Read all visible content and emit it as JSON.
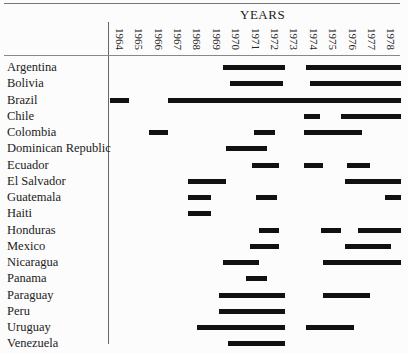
{
  "chart_data": {
    "type": "gantt",
    "title": "YEARS",
    "xlabel": "YEARS",
    "ylabel": "",
    "x_ticks": [
      "1964",
      "1965",
      "1966",
      "1967",
      "1968",
      "1969",
      "1970",
      "1971",
      "1972",
      "1973",
      "1974",
      "1975",
      "1976",
      "1977",
      "1978"
    ],
    "x_range": [
      1964,
      1979
    ],
    "grid": false,
    "legend": null,
    "rows": [
      {
        "label": "Argentina",
        "bars": [
          [
            1969.8,
            1973.0
          ],
          [
            1974.1,
            1979.0
          ]
        ]
      },
      {
        "label": "Bolivia",
        "bars": [
          [
            1970.2,
            1972.9
          ],
          [
            1974.3,
            1979.0
          ]
        ]
      },
      {
        "label": "Brazil",
        "bars": [
          [
            1964.0,
            1965.0
          ],
          [
            1967.0,
            1979.0
          ]
        ]
      },
      {
        "label": "Chile",
        "bars": [
          [
            1974.0,
            1974.8
          ],
          [
            1975.9,
            1979.0
          ]
        ]
      },
      {
        "label": "Colombia",
        "bars": [
          [
            1966.0,
            1967.0
          ],
          [
            1971.4,
            1972.5
          ],
          [
            1974.0,
            1977.0
          ]
        ]
      },
      {
        "label": "Dominican Republic",
        "bars": [
          [
            1970.0,
            1972.1
          ]
        ]
      },
      {
        "label": "Ecuador",
        "bars": [
          [
            1971.3,
            1972.7
          ],
          [
            1974.0,
            1975.0
          ],
          [
            1976.2,
            1977.4
          ]
        ]
      },
      {
        "label": "El Salvador",
        "bars": [
          [
            1968.0,
            1970.0
          ],
          [
            1976.1,
            1979.0
          ]
        ]
      },
      {
        "label": "Guatemala",
        "bars": [
          [
            1968.0,
            1969.2
          ],
          [
            1971.5,
            1972.6
          ],
          [
            1978.2,
            1979.0
          ]
        ]
      },
      {
        "label": "Haiti",
        "bars": [
          [
            1968.0,
            1969.2
          ]
        ]
      },
      {
        "label": "Honduras",
        "bars": [
          [
            1971.7,
            1972.7
          ],
          [
            1974.9,
            1975.9
          ],
          [
            1976.8,
            1979.0
          ]
        ]
      },
      {
        "label": "Mexico",
        "bars": [
          [
            1971.2,
            1972.7
          ],
          [
            1976.1,
            1978.5
          ]
        ]
      },
      {
        "label": "Nicaragua",
        "bars": [
          [
            1969.8,
            1971.7
          ],
          [
            1975.0,
            1979.0
          ]
        ]
      },
      {
        "label": "Panama",
        "bars": [
          [
            1971.0,
            1972.1
          ]
        ]
      },
      {
        "label": "Paraguay",
        "bars": [
          [
            1969.6,
            1973.0
          ],
          [
            1975.0,
            1977.4
          ]
        ]
      },
      {
        "label": "Peru",
        "bars": [
          [
            1969.6,
            1973.0
          ]
        ]
      },
      {
        "label": "Uruguay",
        "bars": [
          [
            1968.5,
            1973.0
          ],
          [
            1974.1,
            1976.6
          ]
        ]
      },
      {
        "label": "Venezuela",
        "bars": [
          [
            1970.1,
            1973.0
          ]
        ]
      }
    ]
  }
}
